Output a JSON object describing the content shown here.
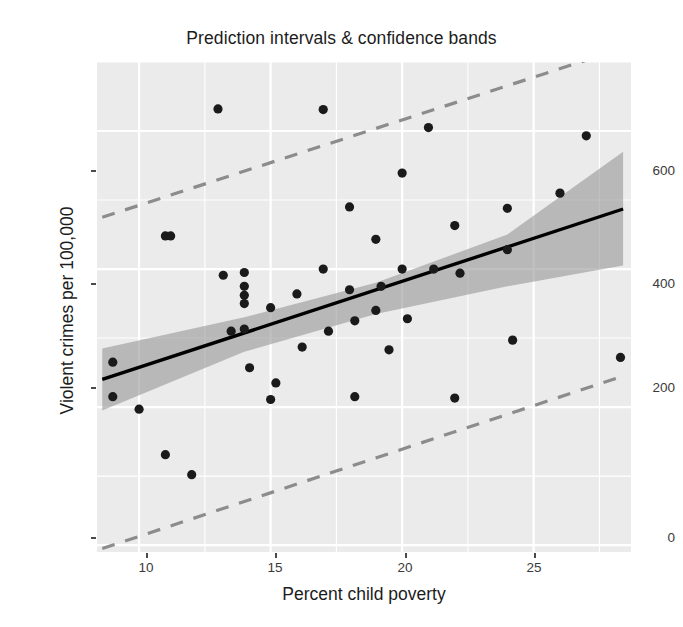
{
  "chart_data": {
    "type": "scatter",
    "title": "Prediction intervals & confidence bands",
    "xlabel": "Percent child poverty",
    "ylabel": "Violent crimes per 100,000",
    "xlim": [
      8.4,
      28.7
    ],
    "ylim": [
      -10,
      700
    ],
    "xticks": [
      10,
      15,
      20,
      25
    ],
    "yticks": [
      0,
      200,
      400,
      600
    ],
    "grid": true,
    "legend": "none",
    "panel_background": "#ebebeb",
    "grid_color": "#ffffff",
    "point_color": "#1a1a1a",
    "fit_line_color": "#000000",
    "confidence_band_color": "#9a9a9a",
    "prediction_interval_color": "#8c8c8c",
    "prediction_interval_style": "dashed",
    "x": [
      9.0,
      9.0,
      10.0,
      11.0,
      11.0,
      11.2,
      12.0,
      13.0,
      13.2,
      13.5,
      14.0,
      14.0,
      14.0,
      14.0,
      14.0,
      14.2,
      15.0,
      15.0,
      15.2,
      16.0,
      16.2,
      17.0,
      17.0,
      17.2,
      18.0,
      18.0,
      18.2,
      18.2,
      19.0,
      19.0,
      19.2,
      19.5,
      20.0,
      20.0,
      20.2,
      21.0,
      21.2,
      22.0,
      22.0,
      22.2,
      24.0,
      24.0,
      24.2,
      26.0,
      27.0,
      28.3
    ],
    "y": [
      265,
      215,
      197,
      448,
      131,
      448,
      102,
      632,
      391,
      310,
      313,
      350,
      362,
      375,
      395,
      257,
      211,
      344,
      235,
      364,
      287,
      631,
      400,
      310,
      490,
      370,
      215,
      325,
      443,
      340,
      375,
      283,
      539,
      400,
      328,
      605,
      400,
      213,
      463,
      394,
      428,
      488,
      297,
      510,
      593,
      272
    ],
    "fit_line": {
      "x": [
        8.6,
        28.4
      ],
      "y": [
        240,
        487
      ],
      "slope": 12.5,
      "intercept": 132
    },
    "confidence_band": {
      "x": [
        8.6,
        14.0,
        19.0,
        24.0,
        28.4
      ],
      "lower": [
        195,
        280,
        335,
        375,
        405
      ],
      "upper": [
        285,
        330,
        380,
        450,
        570
      ]
    },
    "prediction_interval_upper": {
      "x": [
        8.6,
        28.4
      ],
      "y": [
        475,
        720
      ]
    },
    "prediction_interval_lower": {
      "x": [
        8.6,
        28.4
      ],
      "y": [
        -5,
        245
      ]
    }
  },
  "labels": {
    "tick_10": "10",
    "tick_15": "15",
    "tick_20": "20",
    "tick_25": "25",
    "tick_0": "0",
    "tick_200": "200",
    "tick_400": "400",
    "tick_600": "600"
  }
}
